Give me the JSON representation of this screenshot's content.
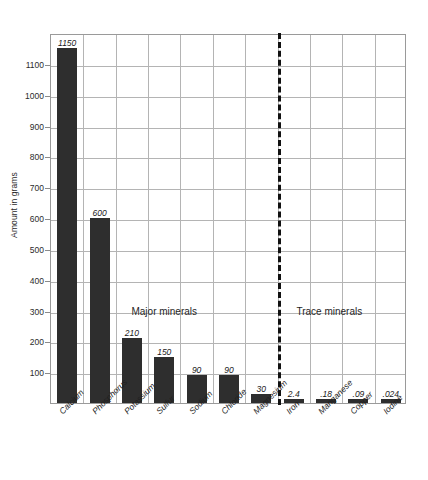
{
  "chart_data": {
    "type": "bar",
    "title": "",
    "subtitle": "",
    "xlabel": "",
    "ylabel": "Amount in grams",
    "ylim": [
      0,
      1200
    ],
    "ytick_step": 100,
    "grid": true,
    "legend": "none",
    "categories": [
      "Calcium",
      "Phosphorus",
      "Potassium",
      "Sulfur",
      "Sodium",
      "Chloride",
      "Magnesium",
      "Iron",
      "Manganese",
      "Copper",
      "Iodine"
    ],
    "values": [
      1150,
      600,
      210,
      150,
      90,
      90,
      30,
      2.4,
      0.18,
      0.09,
      0.024
    ],
    "value_labels": [
      "1150",
      "600",
      "210",
      "150",
      "90",
      "90",
      "30",
      "2.4",
      ".18",
      ".09",
      ".024"
    ],
    "ytick_labels": [
      "100",
      "200",
      "300",
      "400",
      "500",
      "600",
      "700",
      "800",
      "900",
      "1000",
      "1100"
    ],
    "ytick_values": [
      100,
      200,
      300,
      400,
      500,
      600,
      700,
      800,
      900,
      1000,
      1100
    ],
    "annotations": [
      {
        "text": "Major minerals",
        "x_center_category": 3.5
      },
      {
        "text": "Trace minerals",
        "x_center_category": 8.6
      }
    ],
    "divider": {
      "after_category_index": 6,
      "style": "dashed",
      "color": "#111111"
    },
    "bar_color": "#2e2e2e",
    "grid_color": "#b4b4b4",
    "axis_color": "#9a9a9a"
  },
  "footer": {
    "note": ""
  }
}
